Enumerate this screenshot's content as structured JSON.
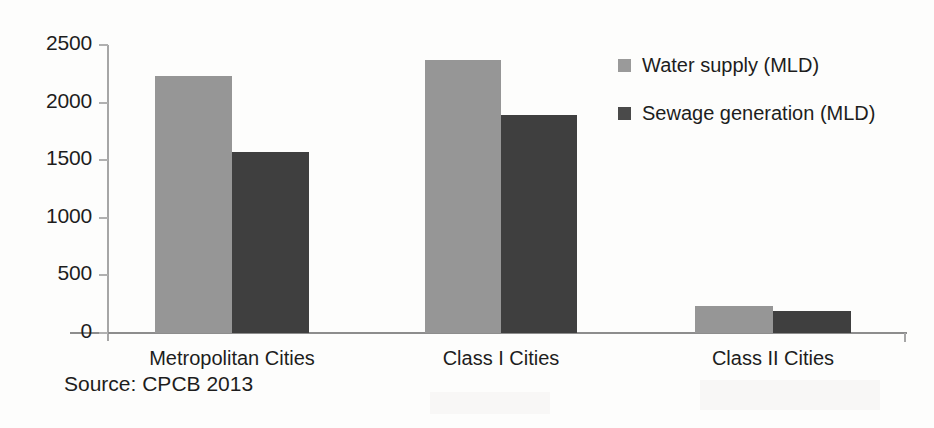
{
  "chart_data": {
    "type": "bar",
    "title": "",
    "xlabel": "",
    "ylabel": "",
    "categories": [
      "Metropolitan Cities",
      "Class I Cities",
      "Class II Cities"
    ],
    "series": [
      {
        "name": "Water supply (MLD)",
        "color": "#969696",
        "values": [
          2230,
          2370,
          235
        ]
      },
      {
        "name": "Sewage generation (MLD)",
        "color": "#3f3f3f",
        "values": [
          1570,
          1890,
          195
        ]
      }
    ],
    "ylim": [
      0,
      2500
    ],
    "yticks": [
      0,
      500,
      1000,
      1500,
      2000,
      2500
    ],
    "ytick_labels": [
      "0",
      "500",
      "1000",
      "1500",
      "2000",
      "2500"
    ],
    "grid": false,
    "legend_position": "right-top",
    "source_note": "Source: CPCB 2013"
  },
  "colors": {
    "water_supply": "#969696",
    "sewage_generation": "#3f3f3f",
    "axis": "#8d8d8d",
    "text": "#1d1d1d",
    "background": "#fdfdfc"
  }
}
